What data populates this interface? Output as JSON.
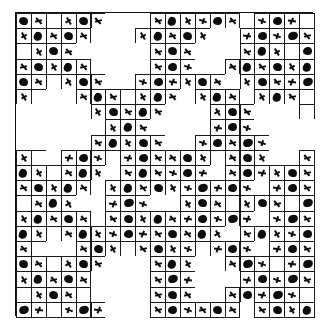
{
  "figure": {
    "pattern_type": "vicsek-cross-fractal",
    "grid_columns": 20,
    "grid_rows": 20,
    "cell_size_px": 14.9,
    "origin_x_px": 15,
    "origin_y_px": 12,
    "border_color": "#111111",
    "cell_line_color": "#1a1a1a",
    "glyph_color": "#0d0d0d",
    "background_color": "#ffffff",
    "glyph_names": [
      "blob-glyph",
      "cross-mark-glyph"
    ],
    "legend": {
      "blob": "solid dark rounded blob",
      "mark": "small slanted cross tick"
    }
  },
  "chart_data": {
    "type": "heatmap",
    "xlabel": "",
    "ylabel": "",
    "grid": true,
    "legend_position": "none",
    "categories_x": [
      "c0",
      "c1",
      "c2",
      "c3",
      "c4",
      "c5",
      "c6",
      "c7",
      "c8",
      "c9",
      "c10",
      "c11",
      "c12",
      "c13",
      "c14",
      "c15",
      "c16",
      "c17",
      "c18",
      "c19"
    ],
    "categories_y": [
      "r0",
      "r1",
      "r2",
      "r3",
      "r4",
      "r5",
      "r6",
      "r7",
      "r8",
      "r9",
      "r10",
      "r11",
      "r12",
      "r13",
      "r14",
      "r15",
      "r16",
      "r17",
      "r18",
      "r19"
    ],
    "value_key": {
      "0": "empty cell, no outline",
      "1": "outlined cell, blank",
      "2": "outlined cell, blob glyph",
      "3": "outlined cell, cross mark glyph"
    },
    "values": [
      [
        2,
        3,
        1,
        3,
        2,
        3,
        0,
        0,
        0,
        3,
        2,
        3,
        3,
        2,
        3,
        0,
        3,
        2,
        3,
        1
      ],
      [
        3,
        2,
        3,
        2,
        3,
        0,
        0,
        0,
        3,
        2,
        3,
        2,
        3,
        0,
        0,
        3,
        2,
        3,
        2,
        3
      ],
      [
        1,
        3,
        2,
        3,
        0,
        0,
        0,
        0,
        0,
        3,
        2,
        3,
        0,
        0,
        0,
        3,
        2,
        3,
        1,
        2
      ],
      [
        3,
        2,
        3,
        2,
        3,
        0,
        0,
        0,
        0,
        3,
        2,
        3,
        0,
        0,
        3,
        2,
        3,
        2,
        3,
        2
      ],
      [
        2,
        3,
        1,
        3,
        2,
        3,
        0,
        0,
        3,
        2,
        3,
        3,
        2,
        3,
        0,
        3,
        2,
        3,
        3,
        2
      ],
      [
        3,
        1,
        0,
        0,
        3,
        2,
        3,
        1,
        3,
        2,
        3,
        0,
        3,
        2,
        3,
        0,
        3,
        2,
        3,
        1
      ],
      [
        0,
        0,
        0,
        0,
        0,
        3,
        2,
        3,
        2,
        3,
        0,
        0,
        0,
        3,
        2,
        3,
        0,
        0,
        0,
        1
      ],
      [
        0,
        0,
        0,
        0,
        0,
        0,
        3,
        2,
        3,
        0,
        0,
        0,
        0,
        3,
        2,
        3,
        0,
        0,
        0,
        0
      ],
      [
        0,
        0,
        0,
        0,
        0,
        3,
        2,
        3,
        2,
        3,
        0,
        0,
        3,
        2,
        3,
        2,
        3,
        0,
        0,
        0
      ],
      [
        3,
        1,
        0,
        3,
        2,
        3,
        1,
        3,
        2,
        3,
        3,
        2,
        3,
        1,
        3,
        2,
        3,
        0,
        0,
        3
      ],
      [
        2,
        3,
        1,
        3,
        2,
        3,
        0,
        3,
        2,
        3,
        3,
        2,
        3,
        0,
        3,
        2,
        3,
        3,
        2,
        3
      ],
      [
        3,
        2,
        3,
        2,
        3,
        0,
        3,
        2,
        3,
        2,
        3,
        3,
        2,
        3,
        2,
        3,
        0,
        3,
        2,
        3
      ],
      [
        1,
        3,
        2,
        3,
        0,
        0,
        3,
        2,
        3,
        0,
        0,
        3,
        2,
        3,
        1,
        3,
        2,
        3,
        1,
        2
      ],
      [
        3,
        2,
        3,
        2,
        3,
        0,
        3,
        2,
        3,
        2,
        3,
        3,
        2,
        3,
        2,
        3,
        0,
        3,
        2,
        3
      ],
      [
        2,
        3,
        1,
        3,
        2,
        3,
        3,
        2,
        3,
        3,
        2,
        3,
        2,
        3,
        0,
        3,
        2,
        3,
        3,
        2
      ],
      [
        3,
        1,
        0,
        0,
        3,
        2,
        3,
        1,
        3,
        2,
        3,
        3,
        1,
        3,
        2,
        3,
        0,
        3,
        2,
        3
      ],
      [
        2,
        3,
        1,
        3,
        2,
        3,
        0,
        0,
        0,
        3,
        2,
        3,
        0,
        0,
        3,
        2,
        3,
        1,
        3,
        2
      ],
      [
        3,
        2,
        3,
        2,
        3,
        0,
        0,
        0,
        0,
        3,
        2,
        3,
        0,
        0,
        0,
        3,
        2,
        3,
        2,
        3
      ],
      [
        1,
        3,
        2,
        3,
        1,
        0,
        0,
        0,
        0,
        3,
        2,
        3,
        0,
        0,
        3,
        2,
        3,
        2,
        3,
        1
      ],
      [
        2,
        3,
        1,
        3,
        2,
        3,
        0,
        0,
        0,
        3,
        2,
        3,
        3,
        2,
        3,
        0,
        3,
        2,
        3,
        2
      ]
    ]
  }
}
